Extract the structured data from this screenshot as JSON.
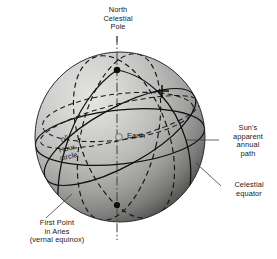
{
  "figure": {
    "background_color": "#ffffff"
  },
  "labels": {
    "north_celestial_pole": "North\nCelestial\nPole",
    "suns_apparent_annual_path": "Sun's\napparent\nannual\npath",
    "celestial_equator": "Celestial\nequator",
    "first_point_in_aries": "First Point\nin Aries\n(vernal equinox)",
    "hour_circle_value": "0",
    "hour_circle_superscript": "h",
    "hour_circle_rest": "\nHour\ncircle",
    "earth": "Earth"
  },
  "colors": {
    "sphere_light": "#d8d8d6",
    "sphere_mid": "#b4b4b2",
    "sphere_dark": "#6f6f6f",
    "sphere_darkest": "#3a3a3a",
    "line": "#121212",
    "text": "#16181a",
    "leader": "#3c3c3c",
    "earth_fill": "#c9c9c7"
  },
  "geometry": {
    "sphere_center_x": 120,
    "sphere_center_y": 137,
    "sphere_radius": 85,
    "north_pole_x": 117,
    "north_pole_y": 70,
    "south_pole_x": 117,
    "south_pole_y": 205,
    "earth_x": 119,
    "earth_y": 137,
    "ecliptic_crossing_x": 162,
    "ecliptic_crossing_y": 91
  },
  "elements": {
    "polar_axis": "polar-axis-dash-dot-line",
    "north_pole_marker": "north-pole-dot",
    "south_pole_marker": "south-pole-dot",
    "earth_marker": "earth-dot",
    "summer_solstice_marker": "cross-mark",
    "celestial_equator_curve": "solid-ellipse",
    "ecliptic_curve": "solid-tilted-ellipse",
    "hour_circle_curve": "dashed-meridian",
    "secondary_dashed_circles": "dashed-great-circles"
  }
}
